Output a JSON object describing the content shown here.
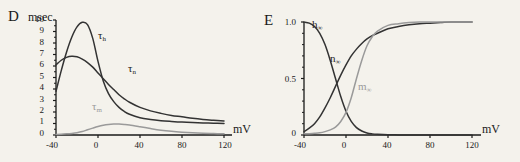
{
  "figure": {
    "background_color": "#f4f2ec",
    "panels": [
      {
        "letter": "D",
        "y_unit": "msec",
        "x_unit": "mV",
        "y_ticks": [
          "0",
          "1",
          "2",
          "3",
          "4",
          "5",
          "6",
          "7",
          "8",
          "9",
          "10"
        ],
        "x_ticks": [
          "-40",
          "0",
          "40",
          "80",
          "120"
        ],
        "curve_labels": [
          {
            "base": "τ",
            "sub": "h",
            "color": "#333333"
          },
          {
            "base": "τ",
            "sub": "n",
            "color": "#333333"
          },
          {
            "base": "τ",
            "sub": "m",
            "color": "#9a9a9a"
          }
        ]
      },
      {
        "letter": "E",
        "y_unit": "",
        "x_unit": "mV",
        "y_ticks": [
          "0",
          "0.5",
          "1.0"
        ],
        "x_ticks": [
          "-40",
          "0",
          "40",
          "80",
          "120"
        ],
        "curve_labels": [
          {
            "base": "h",
            "sub": "∞",
            "color": "#333333"
          },
          {
            "base": "n",
            "sub": "∞",
            "color": "#333333"
          },
          {
            "base": "m",
            "sub": "∞",
            "color": "#9a9a9a"
          }
        ]
      }
    ]
  },
  "chart_data": [
    {
      "type": "line",
      "title": "D",
      "xlabel": "mV",
      "ylabel": "msec",
      "xlim": [
        -40,
        120
      ],
      "ylim": [
        0,
        10
      ],
      "grid": false,
      "legend": "inline-annotations",
      "xticks": [
        -40,
        0,
        40,
        80,
        120
      ],
      "yticks": [
        0,
        1,
        2,
        3,
        4,
        5,
        6,
        7,
        8,
        9,
        10
      ],
      "series": [
        {
          "name": "tau_h",
          "label": "τh",
          "color": "#333333",
          "x": [
            -40,
            -35,
            -30,
            -25,
            -20,
            -15,
            -10,
            -5,
            0,
            5,
            10,
            15,
            20,
            25,
            30,
            40,
            50,
            60,
            70,
            80,
            90,
            100,
            110,
            120
          ],
          "y": [
            3.8,
            5.6,
            7.2,
            8.5,
            9.4,
            9.8,
            9.6,
            8.4,
            6.4,
            4.7,
            3.6,
            2.9,
            2.4,
            2.05,
            1.8,
            1.5,
            1.35,
            1.25,
            1.18,
            1.12,
            1.08,
            1.05,
            1.03,
            1.0
          ]
        },
        {
          "name": "tau_n",
          "label": "τn",
          "color": "#333333",
          "x": [
            -40,
            -35,
            -30,
            -25,
            -20,
            -15,
            -10,
            -5,
            0,
            5,
            10,
            15,
            20,
            25,
            30,
            40,
            50,
            60,
            70,
            80,
            90,
            100,
            110,
            120
          ],
          "y": [
            6.1,
            6.5,
            6.75,
            6.85,
            6.8,
            6.6,
            6.3,
            5.9,
            5.4,
            4.9,
            4.4,
            3.95,
            3.5,
            3.15,
            2.85,
            2.4,
            2.1,
            1.88,
            1.7,
            1.58,
            1.45,
            1.35,
            1.28,
            1.22
          ]
        },
        {
          "name": "tau_m",
          "label": "τm",
          "color": "#9a9a9a",
          "x": [
            -40,
            -35,
            -30,
            -25,
            -20,
            -15,
            -10,
            -5,
            0,
            5,
            10,
            15,
            20,
            25,
            30,
            40,
            50,
            60,
            70,
            80,
            90,
            100,
            110,
            120
          ],
          "y": [
            0.05,
            0.07,
            0.1,
            0.14,
            0.2,
            0.3,
            0.45,
            0.6,
            0.74,
            0.85,
            0.92,
            0.95,
            0.95,
            0.92,
            0.87,
            0.72,
            0.56,
            0.42,
            0.32,
            0.25,
            0.2,
            0.16,
            0.13,
            0.1
          ]
        }
      ]
    },
    {
      "type": "line",
      "title": "E",
      "xlabel": "mV",
      "ylabel": "",
      "xlim": [
        -40,
        120
      ],
      "ylim": [
        0,
        1.0
      ],
      "grid": false,
      "legend": "inline-annotations",
      "xticks": [
        -40,
        0,
        40,
        80,
        120
      ],
      "yticks": [
        0,
        0.5,
        1.0
      ],
      "series": [
        {
          "name": "h_inf",
          "label": "h∞",
          "color": "#333333",
          "x": [
            -40,
            -35,
            -30,
            -25,
            -20,
            -15,
            -10,
            -5,
            0,
            5,
            10,
            15,
            20,
            25,
            30,
            40,
            50,
            60,
            80,
            100,
            120
          ],
          "y": [
            1.0,
            0.99,
            0.96,
            0.9,
            0.8,
            0.66,
            0.5,
            0.34,
            0.21,
            0.12,
            0.065,
            0.035,
            0.018,
            0.01,
            0.006,
            0.002,
            0.001,
            0.0,
            0.0,
            0.0,
            0.0
          ]
        },
        {
          "name": "n_inf",
          "label": "n∞",
          "color": "#333333",
          "x": [
            -40,
            -35,
            -30,
            -25,
            -20,
            -15,
            -10,
            -5,
            0,
            5,
            10,
            15,
            20,
            25,
            30,
            40,
            50,
            60,
            70,
            80,
            90,
            100,
            110,
            120
          ],
          "y": [
            0.03,
            0.06,
            0.1,
            0.16,
            0.24,
            0.33,
            0.43,
            0.53,
            0.62,
            0.7,
            0.76,
            0.81,
            0.85,
            0.88,
            0.9,
            0.94,
            0.96,
            0.975,
            0.985,
            0.99,
            0.995,
            1.0,
            1.0,
            1.0
          ]
        },
        {
          "name": "m_inf",
          "label": "m∞",
          "color": "#9a9a9a",
          "x": [
            -40,
            -35,
            -30,
            -25,
            -20,
            -15,
            -10,
            -5,
            0,
            5,
            10,
            15,
            20,
            25,
            30,
            40,
            50,
            60,
            70,
            80,
            90,
            100,
            110,
            120
          ],
          "y": [
            0.01,
            0.012,
            0.015,
            0.02,
            0.03,
            0.045,
            0.07,
            0.12,
            0.2,
            0.33,
            0.5,
            0.66,
            0.79,
            0.87,
            0.92,
            0.97,
            0.985,
            0.995,
            1.0,
            1.0,
            1.0,
            1.0,
            1.0,
            1.0
          ]
        }
      ]
    }
  ]
}
